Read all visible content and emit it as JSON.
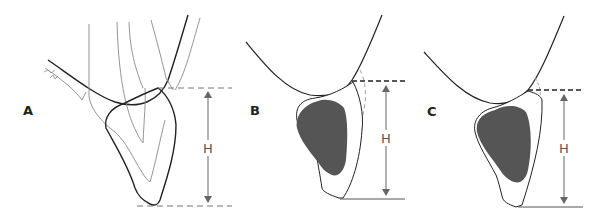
{
  "figure": {
    "panels": [
      {
        "id": "A",
        "label": "A",
        "measure_label": "H",
        "annotation": "scribble"
      },
      {
        "id": "B",
        "label": "B",
        "measure_label": "H"
      },
      {
        "id": "C",
        "label": "C",
        "measure_label": "H"
      }
    ],
    "colors": {
      "line_dark": "#222222",
      "line_light": "#888888",
      "fill_mass": "#555555",
      "background": "#ffffff"
    }
  }
}
